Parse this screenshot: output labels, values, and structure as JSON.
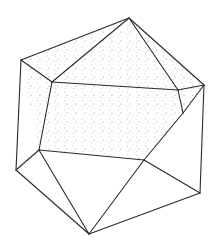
{
  "figure": {
    "background": "#ffffff",
    "stroke_color": "#2a2a2a",
    "stipple_color": "#8a8a8a",
    "vertices": {
      "top": [
        129,
        18
      ],
      "left_upper": [
        21,
        60
      ],
      "right_upper": [
        204,
        85
      ],
      "inner_left": [
        52,
        82
      ],
      "inner_right": [
        178,
        90
      ],
      "inner_right_low": [
        183,
        113
      ],
      "inner_bottom_right": [
        144,
        160
      ],
      "inner_bottom_left": [
        39,
        150
      ],
      "left_lower": [
        16,
        170
      ],
      "right_lower": [
        200,
        193
      ],
      "bottom": [
        89,
        234
      ]
    },
    "stippled_faces": [
      [
        "left_upper",
        "top",
        "inner_left"
      ],
      [
        "top",
        "inner_left",
        "inner_right"
      ],
      [
        "top",
        "right_upper",
        "inner_right"
      ],
      [
        "inner_right",
        "right_upper",
        "inner_right_low"
      ],
      [
        "left_upper",
        "inner_left",
        "inner_bottom_left"
      ],
      [
        "inner_left",
        "inner_right",
        "inner_right_low",
        "inner_bottom_right",
        "inner_bottom_left"
      ],
      [
        "inner_right_low",
        "right_upper",
        "inner_bottom_right"
      ]
    ],
    "plain_faces": [
      [
        "left_upper",
        "inner_bottom_left",
        "left_lower"
      ],
      [
        "left_lower",
        "inner_bottom_left",
        "bottom"
      ],
      [
        "inner_bottom_left",
        "inner_bottom_right",
        "bottom"
      ],
      [
        "inner_bottom_right",
        "right_lower",
        "bottom"
      ],
      [
        "inner_bottom_right",
        "right_upper",
        "right_lower"
      ]
    ],
    "edges": [
      [
        "left_upper",
        "top"
      ],
      [
        "top",
        "right_upper"
      ],
      [
        "left_upper",
        "inner_left"
      ],
      [
        "top",
        "inner_left"
      ],
      [
        "top",
        "inner_right"
      ],
      [
        "inner_left",
        "inner_right"
      ],
      [
        "inner_right",
        "right_upper"
      ],
      [
        "inner_right",
        "inner_right_low"
      ],
      [
        "inner_right_low",
        "right_upper"
      ],
      [
        "inner_left",
        "inner_bottom_left"
      ],
      [
        "inner_right_low",
        "inner_bottom_right"
      ],
      [
        "inner_bottom_left",
        "inner_bottom_right"
      ],
      [
        "left_upper",
        "left_lower"
      ],
      [
        "left_lower",
        "inner_bottom_left"
      ],
      [
        "left_lower",
        "bottom"
      ],
      [
        "inner_bottom_left",
        "bottom"
      ],
      [
        "inner_bottom_right",
        "bottom"
      ],
      [
        "inner_bottom_right",
        "right_lower"
      ],
      [
        "right_upper",
        "right_lower"
      ],
      [
        "right_lower",
        "bottom"
      ]
    ]
  }
}
